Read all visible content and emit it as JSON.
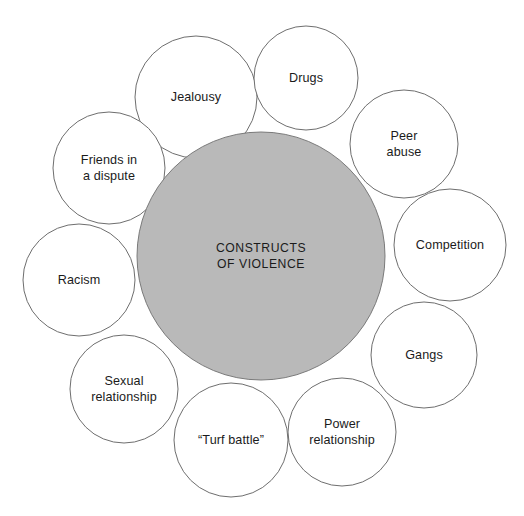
{
  "diagram": {
    "type": "radial-cluster-diagram",
    "title": "Constructs of Violence",
    "canvas": {
      "width": 524,
      "height": 516,
      "background": "#ffffff"
    },
    "center": {
      "label": "CONSTRUCTS\nOF VIOLENCE",
      "fill": "#b9b9b9",
      "stroke": "#7a7a7a",
      "cx": 261,
      "cy": 256,
      "r": 124
    },
    "satellite_style": {
      "fill": "#ffffff",
      "stroke": "#6e6e6e",
      "stroke_width": 1
    },
    "satellites": [
      {
        "label": "Jealousy",
        "cx": 196,
        "cy": 97,
        "r": 61
      },
      {
        "label": "Drugs",
        "cx": 306,
        "cy": 78,
        "r": 52
      },
      {
        "label": "Peer\nabuse",
        "cx": 404,
        "cy": 144,
        "r": 54
      },
      {
        "label": "Competition",
        "cx": 450,
        "cy": 245,
        "r": 56
      },
      {
        "label": "Gangs",
        "cx": 424,
        "cy": 355,
        "r": 53
      },
      {
        "label": "Power\nrelationship",
        "cx": 342,
        "cy": 432,
        "r": 54
      },
      {
        "label": "“Turf battle”",
        "cx": 231,
        "cy": 440,
        "r": 57
      },
      {
        "label": "Sexual\nrelationship",
        "cx": 124,
        "cy": 389,
        "r": 54
      },
      {
        "label": "Racism",
        "cx": 79,
        "cy": 280,
        "r": 56
      },
      {
        "label": "Friends in\na dispute",
        "cx": 109,
        "cy": 168,
        "r": 56
      }
    ]
  }
}
